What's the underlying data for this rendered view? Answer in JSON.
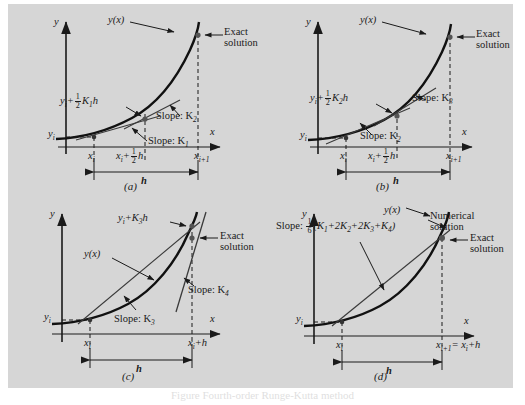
{
  "figure": {
    "background_color": "#d6d6d6",
    "ink_color": "#1a1a1a",
    "panels": [
      {
        "id": "a",
        "caption": "(a)",
        "axis_y_label": "y",
        "axis_x_label": "x",
        "curve_label": "y(x)",
        "y_start_label": "y",
        "y_start_sub": "i",
        "estimate_label_prefix": "y",
        "estimate_label_sub": "i",
        "estimate_label_suffix": "K",
        "estimate_label_suffix_sub": "1",
        "estimate_label_tail": "h",
        "estimate_fraction_num": "1",
        "estimate_fraction_den": "2",
        "slope_labels": [
          {
            "text": "Slope: K",
            "sub": "1"
          },
          {
            "text": "Slope: K",
            "sub": "2"
          }
        ],
        "annotation": "Exact\nsolution",
        "annotation_line1": "Exact",
        "annotation_line2": "solution",
        "tick_left": "x",
        "tick_left_sub": "i",
        "tick_mid_prefix": "x",
        "tick_mid_sub": "i",
        "tick_mid_tail": "h",
        "tick_mid_num": "1",
        "tick_mid_den": "2",
        "tick_right": "x",
        "tick_right_sub": "i+1",
        "span_label": "h"
      },
      {
        "id": "b",
        "caption": "(b)",
        "axis_y_label": "y",
        "axis_x_label": "x",
        "curve_label": "y(x)",
        "y_start_label": "y",
        "y_start_sub": "i",
        "estimate_label_prefix": "y",
        "estimate_label_sub": "i",
        "estimate_label_suffix": "K",
        "estimate_label_suffix_sub": "2",
        "estimate_label_tail": "h",
        "estimate_fraction_num": "1",
        "estimate_fraction_den": "2",
        "slope_labels": [
          {
            "text": "Slope: K",
            "sub": "2"
          },
          {
            "text": "Slope: K",
            "sub": "3"
          }
        ],
        "annotation_line1": "Exact",
        "annotation_line2": "solution",
        "tick_left": "x",
        "tick_left_sub": "i",
        "tick_mid_prefix": "x",
        "tick_mid_sub": "i",
        "tick_mid_tail": "h",
        "tick_mid_num": "1",
        "tick_mid_den": "2",
        "tick_right": "x",
        "tick_right_sub": "i+1",
        "span_label": "h"
      },
      {
        "id": "c",
        "caption": "(c)",
        "axis_y_label": "y",
        "axis_x_label": "x",
        "curve_label": "y(x)",
        "y_start_label": "y",
        "y_start_sub": "i",
        "estimate_label_prefix": "y",
        "estimate_label_sub": "i",
        "estimate_label_suffix": "K",
        "estimate_label_suffix_sub": "3",
        "estimate_label_tail": "h",
        "slope_labels": [
          {
            "text": "Slope: K",
            "sub": "3"
          },
          {
            "text": "Slope: K",
            "sub": "4"
          }
        ],
        "annotation_line1": "Exact",
        "annotation_line2": "solution",
        "tick_left": "x",
        "tick_left_sub": "i",
        "tick_right_prefix": "x",
        "tick_right_sub": "i",
        "tick_right_tail": "+h",
        "span_label": "h"
      },
      {
        "id": "d",
        "caption": "(d)",
        "axis_y_label": "y",
        "axis_x_label": "x",
        "curve_label": "y(x)",
        "y_start_label": "y",
        "y_start_sub": "i",
        "slope_formula_prefix": "Slope:",
        "slope_formula_num": "1",
        "slope_formula_den": "6",
        "slope_formula_body": "(K",
        "slope_formula_terms": "(K1+2K2+2K3+K4)",
        "annotation_numeric_line1": "Numerical",
        "annotation_numeric_line2": "solution",
        "annotation_exact_line1": "Exact",
        "annotation_exact_line2": "solution",
        "tick_left": "x",
        "tick_left_sub": "i",
        "tick_right_prefix": "x",
        "tick_right_sub": "i+1",
        "tick_right_mid": "= x",
        "tick_right_sub2": "i",
        "tick_right_tail": "+h",
        "span_label": "h"
      }
    ]
  },
  "caption": {
    "text": "Figure  Fourth-order Runge-Kutta method"
  }
}
